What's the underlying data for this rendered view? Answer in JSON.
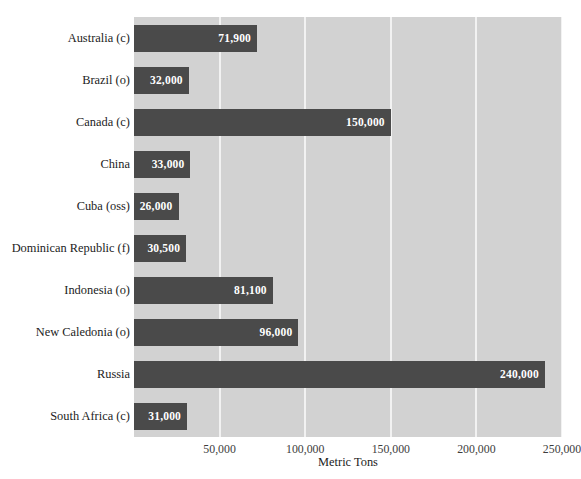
{
  "chart_data": {
    "type": "bar",
    "orientation": "horizontal",
    "title": "",
    "xlabel": "Metric Tons",
    "ylabel": "",
    "categories": [
      "Australia (c)",
      "Brazil (o)",
      "Canada (c)",
      "China",
      "Cuba (oss)",
      "Dominican Republic (f)",
      "Indonesia (o)",
      "New Caledonia (o)",
      "Russia",
      "South Africa (c)"
    ],
    "values": [
      71900,
      32000,
      150000,
      33000,
      26000,
      30500,
      81100,
      96000,
      240000,
      31000
    ],
    "value_labels": [
      "71,900",
      "32,000",
      "150,000",
      "33,000",
      "26,000",
      "30,500",
      "81,100",
      "96,000",
      "240,000",
      "31,000"
    ],
    "xlim": [
      0,
      250000
    ],
    "xticks": [
      50000,
      100000,
      150000,
      200000,
      250000
    ],
    "xtick_labels": [
      "50,000",
      "100,000",
      "150,000",
      "200,000",
      "250,000"
    ],
    "grid": "vertical-only",
    "legend": "none",
    "colors": {
      "bar": "#4a4a4a",
      "plot_background": "#d2d2d2",
      "gridline": "#f2f2f2",
      "value_label": "#ffffff",
      "figure_background": "#ffffff",
      "text": "#1c1c1c"
    }
  }
}
